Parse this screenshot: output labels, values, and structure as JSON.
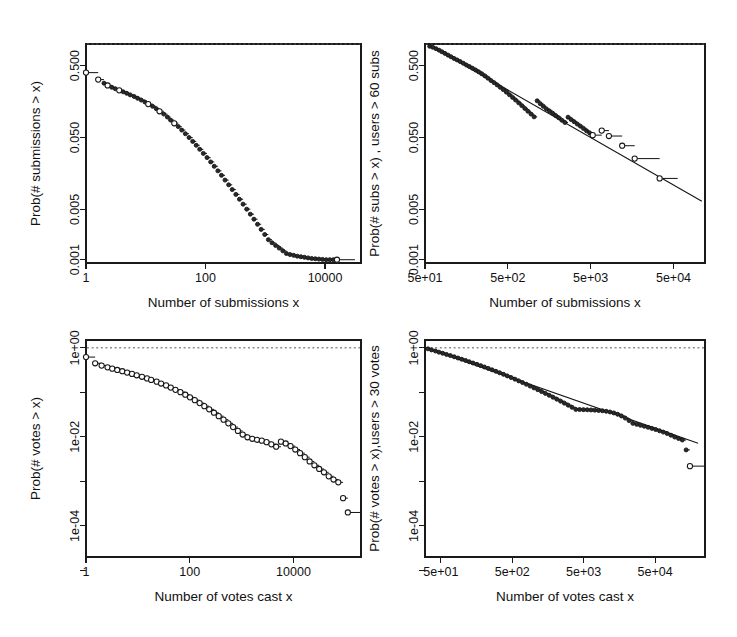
{
  "figure": {
    "title": "",
    "background": "#ffffff",
    "foreground": "#111111",
    "panel_count": 4
  },
  "chart_data": [
    {
      "id": "top-left",
      "type": "scatter",
      "title": "",
      "xlabel": "Number of submissions x",
      "ylabel": "Prob(# submissions > x)",
      "xscale": "log",
      "yscale": "log",
      "xlim": [
        1,
        40000
      ],
      "ylim": [
        0.0009,
        1.0
      ],
      "xticks": [
        1,
        100,
        10000
      ],
      "xticklabels": [
        "1",
        "100",
        "10000"
      ],
      "yticks": [
        0.5,
        0.05,
        0.005,
        0.001
      ],
      "yticklabels": [
        "0.500",
        "0.050",
        "0.005",
        "0.001"
      ],
      "grid": false,
      "legend": "none",
      "reference_line": {
        "y": 1.0,
        "style": "dashed"
      },
      "fit_line": null,
      "marker": "open-circle",
      "series": [
        {
          "name": "Complementary CDF of submissions per user",
          "x": [
            1,
            1.6,
            2,
            2.3,
            2.7,
            3.1,
            3.6,
            4.2,
            4.8,
            5.5,
            6.4,
            7.3,
            8.4,
            9.7,
            11,
            13,
            15,
            17,
            20,
            23,
            26,
            30,
            35,
            40,
            46,
            53,
            61,
            70,
            80,
            92,
            106,
            122,
            140,
            161,
            185,
            212,
            244,
            280,
            322,
            370,
            425,
            489,
            562,
            646,
            742,
            853,
            980,
            1127,
            1295,
            1488,
            1710,
            1966,
            2259,
            2596,
            2984,
            3429,
            3941,
            4529,
            5205,
            5982,
            6874,
            7900,
            9080,
            10435,
            11993,
            13783,
            15840
          ],
          "y": [
            0.4,
            0.32,
            0.285,
            0.265,
            0.25,
            0.238,
            0.227,
            0.216,
            0.206,
            0.196,
            0.186,
            0.176,
            0.166,
            0.156,
            0.146,
            0.136,
            0.126,
            0.116,
            0.106,
            0.0965,
            0.0875,
            0.079,
            0.071,
            0.0635,
            0.0565,
            0.05,
            0.0442,
            0.039,
            0.0343,
            0.0301,
            0.0263,
            0.0229,
            0.0199,
            0.0172,
            0.0149,
            0.0128,
            0.011,
            0.00945,
            0.0081,
            0.00693,
            0.00592,
            0.00505,
            0.0043,
            0.00366,
            0.00311,
            0.00264,
            0.00224,
            0.0019,
            0.00172,
            0.00158,
            0.00145,
            0.00133,
            0.00122,
            0.00118,
            0.00115,
            0.00112,
            0.0011,
            0.00108,
            0.00106,
            0.00104,
            0.00103,
            0.00102,
            0.00101,
            0.001,
            0.001,
            0.001,
            0.001
          ]
        }
      ]
    },
    {
      "id": "top-right",
      "type": "scatter",
      "title": "",
      "xlabel": "Number of submissions x",
      "ylabel": "Prob(# subs > x) , users > 60 subs",
      "xscale": "log",
      "yscale": "log",
      "xlim": [
        50,
        120000
      ],
      "ylim": [
        0.0009,
        1.0
      ],
      "xticks": [
        50,
        500,
        5000,
        50000
      ],
      "xticklabels": [
        "5e+01",
        "5e+02",
        "5e+03",
        "5e+04"
      ],
      "yticks": [
        0.5,
        0.05,
        0.005,
        0.001
      ],
      "yticklabels": [
        "0.500",
        "0.050",
        "0.005",
        "0.001"
      ],
      "grid": false,
      "legend": "none",
      "reference_line": {
        "y": 1.0,
        "style": "dashed"
      },
      "fit_line": {
        "type": "power-law",
        "x0": 60,
        "y0": 0.93,
        "x1": 110000,
        "y1": 0.0065,
        "note": "linear fit in log-log space"
      },
      "marker": "open-circle",
      "series": [
        {
          "name": "Complementary CDF, users with > 60 submissions",
          "x": [
            57,
            62,
            68,
            74,
            80,
            87,
            95,
            103,
            112,
            122,
            133,
            145,
            158,
            172,
            187,
            204,
            222,
            242,
            264,
            287,
            313,
            341,
            371,
            404,
            440,
            480,
            523,
            570,
            620,
            676,
            736,
            802,
            874,
            952,
            1037,
            1130,
            1231,
            1341,
            1461,
            1592,
            1735,
            1890,
            2060,
            2244,
            2445,
            2664,
            2903,
            3163,
            3447,
            3756,
            4092,
            4459,
            4858,
            5293,
            6800,
            8300,
            12000,
            17000,
            34000
          ],
          "y": [
            0.93,
            0.9,
            0.86,
            0.82,
            0.78,
            0.74,
            0.7,
            0.665,
            0.63,
            0.6,
            0.57,
            0.54,
            0.51,
            0.485,
            0.46,
            0.435,
            0.41,
            0.385,
            0.36,
            0.335,
            0.31,
            0.29,
            0.27,
            0.25,
            0.232,
            0.214,
            0.197,
            0.181,
            0.166,
            0.152,
            0.139,
            0.127,
            0.116,
            0.106,
            0.097,
            0.162,
            0.148,
            0.136,
            0.125,
            0.117,
            0.109,
            0.101,
            0.094,
            0.087,
            0.081,
            0.096,
            0.089,
            0.083,
            0.077,
            0.072,
            0.067,
            0.062,
            0.058,
            0.054,
            0.0625,
            0.0525,
            0.0385,
            0.0255,
            0.0135
          ]
        }
      ]
    },
    {
      "id": "bottom-left",
      "type": "scatter",
      "title": "",
      "xlabel": "Number of votes cast x",
      "ylabel": "Prob(# votes > x)",
      "xscale": "log",
      "yscale": "log",
      "xlim": [
        1,
        200000
      ],
      "ylim": [
        2e-05,
        1.5
      ],
      "xticks": [
        1,
        100,
        10000
      ],
      "xticklabels": [
        "1",
        "100",
        "10000"
      ],
      "yticks": [
        1,
        0.01,
        0.0001
      ],
      "yticklabels": [
        "1e+00",
        "1e-02",
        "1e-04"
      ],
      "minor_yticks": [
        0.1,
        0.001,
        1e-05
      ],
      "grid": false,
      "legend": "none",
      "reference_line": {
        "y": 1.0,
        "style": "dashed"
      },
      "fit_line": null,
      "marker": "open-circle",
      "series": [
        {
          "name": "Complementary CDF of votes cast per user",
          "x": [
            1,
            1.5,
            2,
            2.6,
            3.2,
            4,
            5,
            6.2,
            7.7,
            9.5,
            12,
            15,
            18,
            23,
            28,
            35,
            43,
            53,
            66,
            82,
            101,
            125,
            155,
            191,
            237,
            293,
            362,
            448,
            554,
            685,
            847,
            1047,
            1295,
            1601,
            1980,
            2448,
            3027,
            3743,
            4628,
            5722,
            7075,
            8748,
            10816,
            13372,
            16532,
            20440,
            25270,
            31242,
            38625,
            47752,
            59037,
            72985,
            90230,
            111550
          ],
          "y": [
            0.62,
            0.45,
            0.4,
            0.365,
            0.34,
            0.318,
            0.298,
            0.278,
            0.26,
            0.242,
            0.224,
            0.206,
            0.19,
            0.174,
            0.158,
            0.143,
            0.128,
            0.114,
            0.101,
            0.0885,
            0.0772,
            0.0668,
            0.0574,
            0.049,
            0.0415,
            0.0349,
            0.0292,
            0.0243,
            0.0201,
            0.0166,
            0.0136,
            0.0113,
            0.0098,
            0.00905,
            0.0086,
            0.0082,
            0.0076,
            0.0068,
            0.006,
            0.0078,
            0.0071,
            0.0062,
            0.0052,
            0.0043,
            0.0035,
            0.0028,
            0.0023,
            0.0019,
            0.0016,
            0.0013,
            0.0011,
            0.00095,
            0.00042,
            0.0002
          ]
        }
      ]
    },
    {
      "id": "bottom-right",
      "type": "scatter",
      "title": "",
      "xlabel": "Number of votes cast x",
      "ylabel": "Prob(# votes > x),users > 30 votes",
      "xscale": "log",
      "yscale": "log",
      "xlim": [
        30,
        250000
      ],
      "ylim": [
        2e-05,
        1.5
      ],
      "xticks": [
        50,
        500,
        5000,
        50000
      ],
      "xticklabels": [
        "5e+01",
        "5e+02",
        "5e+03",
        "5e+04"
      ],
      "yticks": [
        1,
        0.01,
        0.0001
      ],
      "yticklabels": [
        "1e+00",
        "1e-02",
        "1e-04"
      ],
      "minor_yticks": [
        0.1,
        0.001,
        1e-05
      ],
      "grid": false,
      "legend": "none",
      "reference_line": {
        "y": 1.0,
        "style": "dashed"
      },
      "fit_line": {
        "type": "power-law",
        "x0": 34,
        "y0": 0.95,
        "x1": 200000,
        "y1": 0.0072,
        "note": "linear fit in log-log space"
      },
      "marker": "open-circle",
      "series": [
        {
          "name": "Complementary CDF, users with > 30 votes",
          "x": [
            33,
            37,
            42,
            47,
            53,
            60,
            68,
            77,
            87,
            98,
            111,
            125,
            141,
            160,
            181,
            204,
            231,
            261,
            295,
            333,
            377,
            426,
            482,
            545,
            616,
            696,
            787,
            890,
            1006,
            1137,
            1286,
            1453,
            1643,
            1857,
            2100,
            2374,
            2684,
            3034,
            3430,
            3878,
            4384,
            4956,
            5603,
            6334,
            7161,
            8095,
            9152,
            10346,
            11697,
            13224,
            14950,
            16901,
            19107,
            21601,
            24420,
            27607,
            31210,
            35284,
            39890,
            45097,
            50985,
            57640,
            65163,
            73667,
            83280,
            94149,
            106437,
            120327,
            136029,
            153780
          ],
          "y": [
            0.95,
            0.9,
            0.85,
            0.8,
            0.755,
            0.71,
            0.67,
            0.63,
            0.59,
            0.555,
            0.52,
            0.487,
            0.456,
            0.426,
            0.398,
            0.371,
            0.345,
            0.32,
            0.297,
            0.275,
            0.254,
            0.234,
            0.215,
            0.198,
            0.181,
            0.166,
            0.152,
            0.138,
            0.126,
            0.115,
            0.104,
            0.0947,
            0.0859,
            0.0778,
            0.0703,
            0.0635,
            0.0572,
            0.0515,
            0.0462,
            0.0414,
            0.0411,
            0.0409,
            0.0406,
            0.0402,
            0.0398,
            0.0392,
            0.0385,
            0.0375,
            0.0362,
            0.0345,
            0.0322,
            0.0295,
            0.0264,
            0.0232,
            0.0201,
            0.0191,
            0.0182,
            0.0173,
            0.0164,
            0.0155,
            0.0146,
            0.0137,
            0.0128,
            0.0119,
            0.0109,
            0.0099,
            0.0092,
            0.0085,
            0.0051,
            0.0022
          ]
        }
      ]
    }
  ]
}
